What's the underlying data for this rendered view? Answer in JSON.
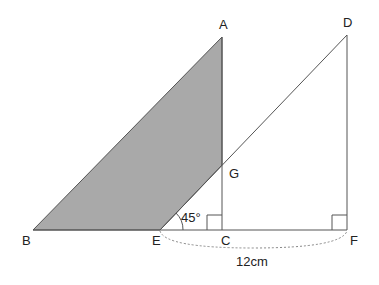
{
  "diagram": {
    "points": {
      "A": {
        "label": "A",
        "x": 222,
        "y": 37
      },
      "D": {
        "label": "D",
        "x": 347,
        "y": 35
      },
      "B": {
        "label": "B",
        "x": 33,
        "y": 230
      },
      "E": {
        "label": "E",
        "x": 160,
        "y": 230
      },
      "C": {
        "label": "C",
        "x": 222,
        "y": 230
      },
      "F": {
        "label": "F",
        "x": 347,
        "y": 230
      },
      "G": {
        "label": "G",
        "x": 222,
        "y": 165
      }
    },
    "angle_label": "45°",
    "length_label": "12cm",
    "colors": {
      "shade": "#a9a9a9",
      "line": "#555555",
      "dashed": "#888888"
    }
  }
}
